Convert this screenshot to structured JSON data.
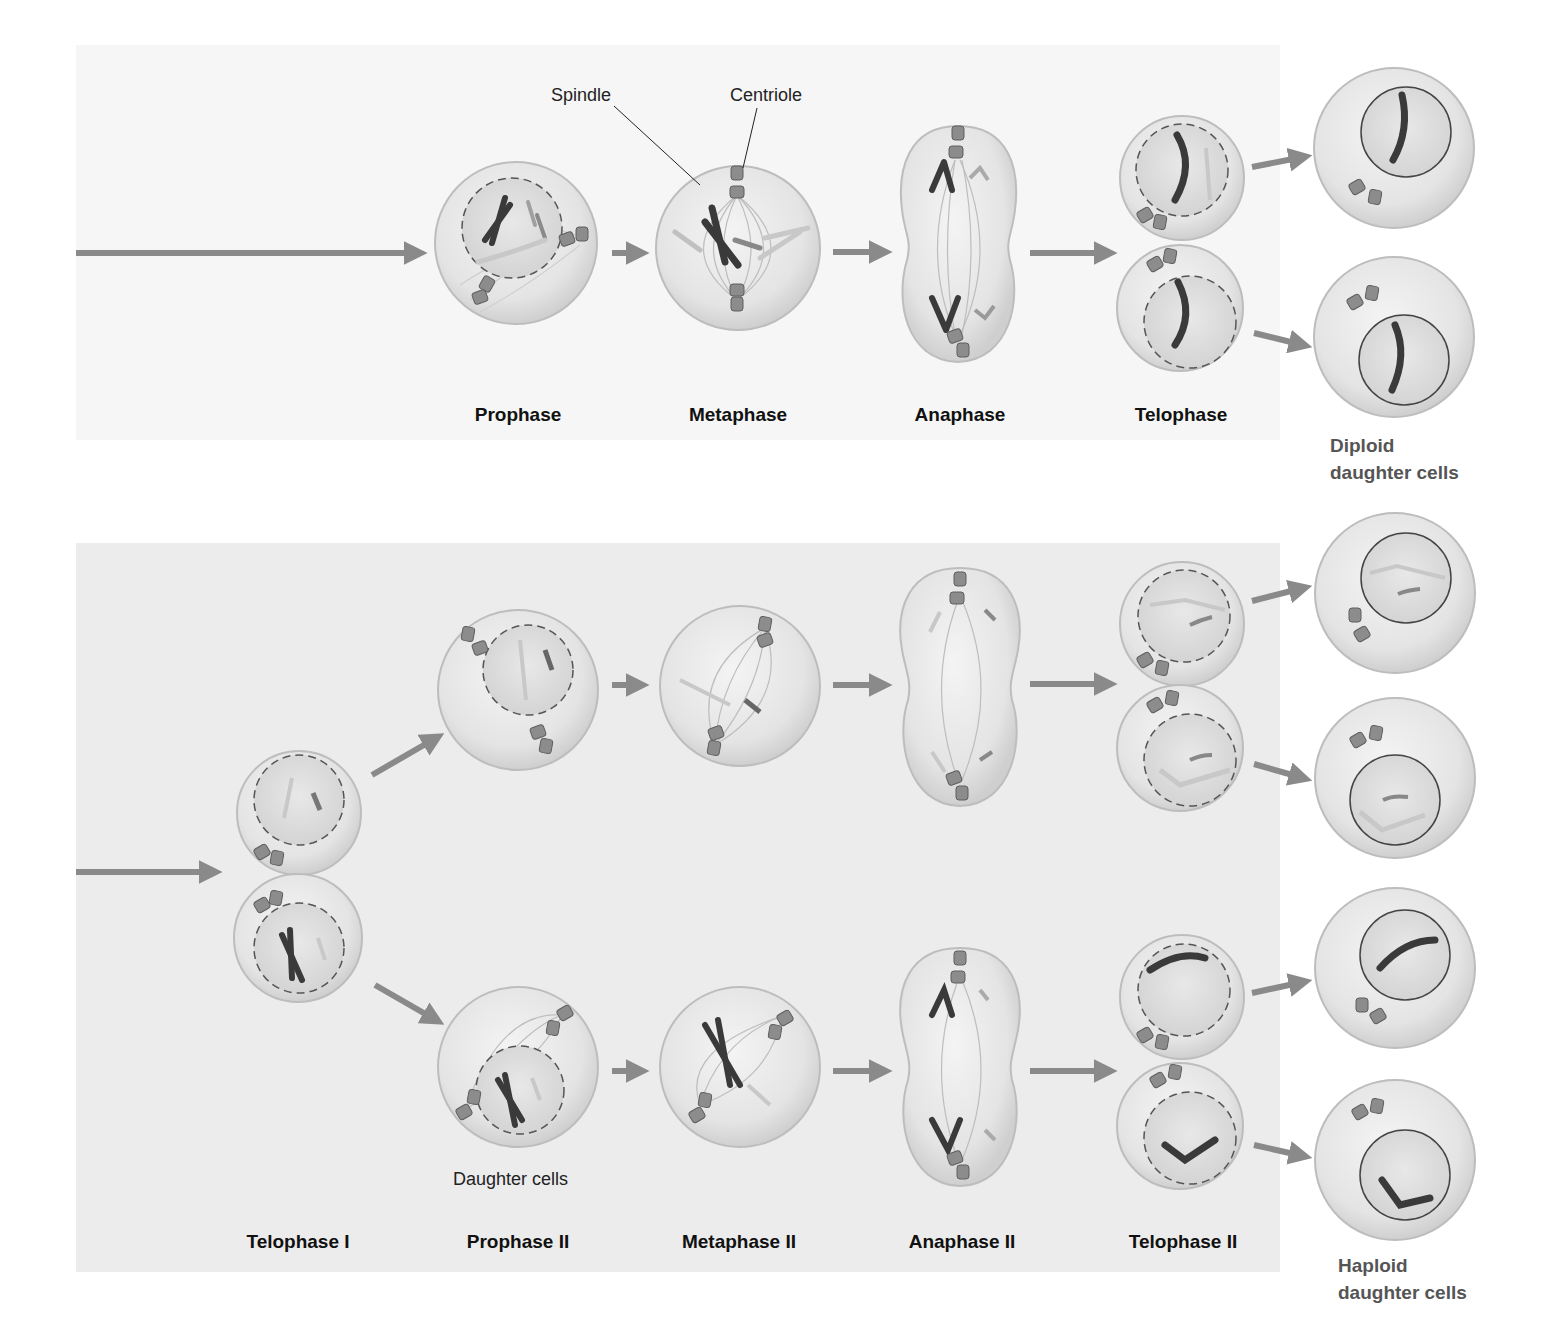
{
  "mitosis": {
    "callouts": {
      "spindle": "Spindle",
      "centriole": "Centriole"
    },
    "stages": [
      {
        "label": "Prophase",
        "x": 518
      },
      {
        "label": "Metaphase",
        "x": 738
      },
      {
        "label": "Anaphase",
        "x": 960
      },
      {
        "label": "Telophase",
        "x": 1181
      }
    ],
    "result_label_line1": "Diploid",
    "result_label_line2": "daughter cells"
  },
  "meiosis_ii": {
    "daughter_cells_note": "Daughter cells",
    "stages": [
      {
        "label": "Telophase I",
        "x": 298
      },
      {
        "label": "Prophase II",
        "x": 518
      },
      {
        "label": "Metaphase II",
        "x": 739
      },
      {
        "label": "Anaphase II",
        "x": 962
      },
      {
        "label": "Telophase II",
        "x": 1183
      }
    ],
    "result_label_line1": "Haploid",
    "result_label_line2": "daughter cells"
  },
  "colors": {
    "arrow": "#8a8a8a",
    "cell_fill": "#e6e6e6",
    "cell_edge": "#bdbdbd",
    "chromosome_dark": "#3a3a3a",
    "chromosome_mid": "#9a9a9a",
    "chromosome_light": "#c8c8c8",
    "centriole": "#8c8c8c"
  }
}
